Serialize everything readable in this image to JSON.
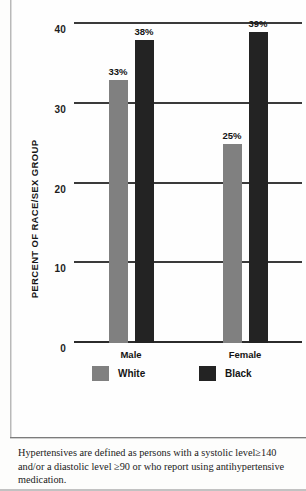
{
  "chart_data": {
    "type": "bar",
    "title": "",
    "subtitle": "",
    "xlabel": "",
    "ylabel": "PERCENT OF RACE/SEX GROUP",
    "ylim": [
      0,
      40
    ],
    "yticks": [
      0,
      10,
      20,
      30,
      40
    ],
    "ytick_labels": [
      "0",
      "10",
      "20",
      "30",
      "40"
    ],
    "grid": true,
    "grid_axis": "y",
    "legend_position": "below-axis",
    "categories": [
      "Male",
      "Female"
    ],
    "series": [
      {
        "name": "White",
        "color": "#808080",
        "values": [
          33,
          25
        ],
        "data_labels": [
          "33%",
          "25%"
        ]
      },
      {
        "name": "Black",
        "color": "#232323",
        "values": [
          38,
          39
        ],
        "data_labels": [
          "38%",
          "39%"
        ]
      }
    ],
    "annotations": []
  },
  "legend": {
    "items": [
      {
        "label": "White",
        "color": "#808080"
      },
      {
        "label": "Black",
        "color": "#232323"
      }
    ]
  },
  "footnote": {
    "text": "Hypertensives are defined as persons with a systolic level≥140 and/or a diastolic level ≥90 or who report using antihypertensive medication."
  }
}
